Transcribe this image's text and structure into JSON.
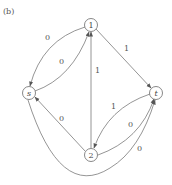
{
  "panel_label": "(b)",
  "nodes": {
    "n1": {
      "label": "1",
      "x": 91,
      "y": 25
    },
    "n2": {
      "label": "2",
      "x": 91,
      "y": 155
    },
    "s": {
      "label": "s",
      "x": 29,
      "y": 93
    },
    "t": {
      "label": "t",
      "x": 156,
      "y": 93
    }
  },
  "edges": [
    {
      "from": "1",
      "to": "s",
      "label": "0"
    },
    {
      "from": "s",
      "to": "1",
      "label": "0"
    },
    {
      "from": "1",
      "to": "t",
      "label": "1"
    },
    {
      "from": "2",
      "to": "1",
      "label": "1"
    },
    {
      "from": "2",
      "to": "s",
      "label": "0"
    },
    {
      "from": "t",
      "to": "2",
      "label": "1"
    },
    {
      "from": "2",
      "to": "t",
      "label": "0"
    },
    {
      "from": "s",
      "to": "t",
      "label": "0"
    }
  ],
  "edge_labels": {
    "e1s": "0",
    "es1": "0",
    "e1t": "1",
    "e21": "1",
    "e2s": "0",
    "et2": "1",
    "e2t": "0",
    "est": "0"
  }
}
